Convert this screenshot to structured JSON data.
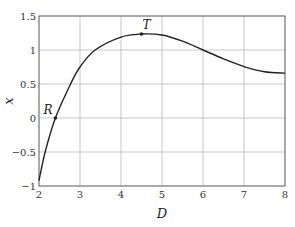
{
  "chart_data": {
    "type": "line",
    "title": "",
    "xlabel": "D",
    "ylabel": "x",
    "xlim": [
      2,
      8
    ],
    "ylim": [
      -1,
      1.5
    ],
    "grid": true,
    "legend": null,
    "xticks": [
      2,
      3,
      4,
      5,
      6,
      7,
      8
    ],
    "yticks": [
      -1,
      -0.5,
      0,
      0.5,
      1,
      1.5
    ],
    "xtick_labels": [
      "2",
      "3",
      "4",
      "5",
      "6",
      "7",
      "8"
    ],
    "ytick_labels": [
      "−1",
      "−0.5",
      "0",
      "0.5",
      "1",
      "1.5"
    ],
    "series": [
      {
        "name": "x(D)",
        "color": "#222222",
        "x": [
          2.0,
          2.15,
          2.4,
          2.77,
          3.0,
          3.37,
          4.0,
          4.5,
          5.0,
          5.5,
          6.0,
          6.5,
          7.0,
          7.5,
          8.0
        ],
        "y": [
          -0.92,
          -0.5,
          0.0,
          0.5,
          0.75,
          1.0,
          1.19,
          1.235,
          1.22,
          1.13,
          1.0,
          0.87,
          0.755,
          0.68,
          0.66
        ]
      }
    ],
    "annotations": [
      {
        "label": "R",
        "x": 2.4,
        "y": 0.0
      },
      {
        "label": "T",
        "x": 4.5,
        "y": 1.235
      }
    ]
  },
  "layout": {
    "plot_left": 39,
    "plot_top": 16,
    "px_per_x": 41,
    "px_per_y": 68
  }
}
